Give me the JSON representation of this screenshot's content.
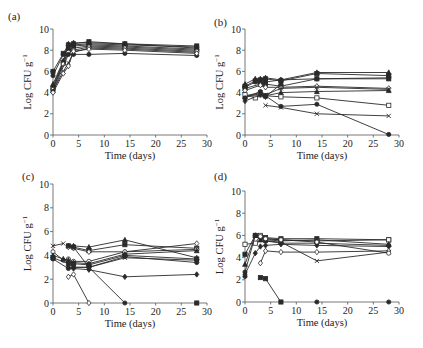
{
  "figure": {
    "background": "#ffffff",
    "line_color": "#2a2a2a",
    "axis_color": "#555555"
  },
  "chart_data": [
    {
      "panel_label": "(a)",
      "type": "line",
      "xlabel": "Time (days)",
      "ylabel": "Log CFU g",
      "ylabel_sup": "−1",
      "xlim": [
        0,
        30
      ],
      "ylim": [
        0,
        10
      ],
      "xticks": [
        0,
        5,
        10,
        15,
        20,
        25,
        30
      ],
      "yticks": [
        0,
        2,
        4,
        6,
        8,
        10
      ],
      "grid": false,
      "legend": "none",
      "frame": {
        "x0": 53,
        "x1": 207,
        "y0": 135,
        "y1": 29,
        "label_x": 8,
        "label_y": 20
      },
      "series": [
        {
          "name": "s1",
          "marker": "square",
          "x": [
            0,
            2,
            3,
            4,
            7,
            14,
            28
          ],
          "y": [
            6.0,
            7.7,
            8.5,
            8.6,
            8.8,
            8.6,
            8.4
          ]
        },
        {
          "name": "s2",
          "marker": "circle",
          "x": [
            0,
            2,
            3,
            4,
            7,
            14,
            28
          ],
          "y": [
            5.6,
            7.6,
            8.3,
            8.5,
            8.6,
            8.5,
            8.3
          ]
        },
        {
          "name": "s3",
          "marker": "triangle",
          "x": [
            0,
            2,
            3,
            4,
            7,
            14,
            28
          ],
          "y": [
            4.8,
            7.0,
            8.6,
            8.7,
            8.7,
            8.6,
            8.2
          ]
        },
        {
          "name": "s4",
          "marker": "diamond",
          "x": [
            0,
            2,
            3,
            4,
            7,
            14,
            28
          ],
          "y": [
            4.6,
            6.9,
            8.4,
            8.4,
            8.5,
            8.4,
            8.1
          ]
        },
        {
          "name": "s5",
          "marker": "square",
          "x": [
            0,
            2,
            3,
            4,
            7,
            14,
            28
          ],
          "y": [
            4.4,
            6.8,
            8.0,
            8.2,
            8.4,
            8.3,
            8.0
          ]
        },
        {
          "name": "s6",
          "marker": "open-circle",
          "x": [
            0,
            2,
            3,
            4,
            7,
            14,
            28
          ],
          "y": [
            4.3,
            6.7,
            7.8,
            8.0,
            8.3,
            8.2,
            7.9
          ]
        },
        {
          "name": "s7",
          "marker": "x",
          "x": [
            0,
            2,
            3,
            4,
            7,
            14,
            28
          ],
          "y": [
            4.2,
            6.0,
            6.8,
            7.8,
            8.2,
            8.1,
            7.8
          ]
        },
        {
          "name": "s8",
          "marker": "circle",
          "x": [
            0,
            3,
            4,
            7,
            14,
            28
          ],
          "y": [
            4.1,
            7.6,
            7.6,
            7.6,
            7.7,
            7.5
          ]
        },
        {
          "name": "s9",
          "marker": "open-diamond",
          "x": [
            0,
            2,
            3,
            4,
            7,
            14,
            28
          ],
          "y": [
            4.0,
            5.8,
            6.5,
            7.9,
            8.1,
            8.0,
            7.7
          ]
        }
      ]
    },
    {
      "panel_label": "(b)",
      "type": "line",
      "xlabel": "Time (days)",
      "ylabel": "Log CFU g",
      "ylabel_sup": "−1",
      "xlim": [
        0,
        30
      ],
      "ylim": [
        0,
        10
      ],
      "xticks": [
        0,
        5,
        10,
        15,
        20,
        25,
        30
      ],
      "yticks": [
        0,
        2,
        4,
        6,
        8,
        10
      ],
      "grid": false,
      "legend": "none",
      "frame": {
        "x0": 245,
        "x1": 399,
        "y0": 135,
        "y1": 29,
        "label_x": 214,
        "label_y": 26
      },
      "series": [
        {
          "name": "s1",
          "marker": "triangle",
          "x": [
            0,
            2,
            3,
            4,
            7,
            14,
            28
          ],
          "y": [
            4.8,
            5.3,
            5.3,
            5.4,
            5.2,
            5.9,
            5.9
          ]
        },
        {
          "name": "s2",
          "marker": "square",
          "x": [
            0,
            2,
            3,
            4,
            7,
            14,
            28
          ],
          "y": [
            4.6,
            5.1,
            5.2,
            5.3,
            5.1,
            5.8,
            5.6
          ]
        },
        {
          "name": "s3",
          "marker": "circle",
          "x": [
            0,
            2,
            3,
            4,
            7,
            14,
            28
          ],
          "y": [
            4.5,
            5.0,
            4.8,
            5.0,
            5.2,
            5.3,
            5.4
          ]
        },
        {
          "name": "s4",
          "marker": "square",
          "x": [
            0,
            3,
            4,
            7,
            14,
            28
          ],
          "y": [
            4.4,
            4.8,
            4.8,
            4.6,
            5.3,
            5.3
          ]
        },
        {
          "name": "s5",
          "marker": "open-diamond",
          "x": [
            0,
            3,
            4,
            7,
            14,
            28
          ],
          "y": [
            4.2,
            4.7,
            4.5,
            4.5,
            4.6,
            4.4
          ]
        },
        {
          "name": "s6",
          "marker": "x",
          "x": [
            0,
            3,
            4,
            7,
            14,
            28
          ],
          "y": [
            3.7,
            4.0,
            3.8,
            4.4,
            4.5,
            4.3
          ]
        },
        {
          "name": "s7",
          "marker": "triangle",
          "x": [
            0,
            3,
            4,
            7,
            14,
            28
          ],
          "y": [
            3.6,
            3.9,
            3.7,
            4.0,
            4.1,
            4.2
          ]
        },
        {
          "name": "s8",
          "marker": "open-square",
          "x": [
            0,
            2,
            3,
            4,
            7,
            14,
            28
          ],
          "y": [
            3.8,
            3.5,
            3.8,
            3.7,
            3.6,
            3.5,
            2.8
          ]
        },
        {
          "name": "s9",
          "marker": "circle",
          "x": [
            0,
            3,
            4,
            7,
            14,
            28
          ],
          "y": [
            3.5,
            4.1,
            3.7,
            2.7,
            2.9,
            0.05
          ]
        },
        {
          "name": "s10",
          "marker": "x",
          "x": [
            4,
            7,
            14,
            28
          ],
          "y": [
            2.8,
            2.6,
            2.0,
            1.8
          ]
        },
        {
          "name": "s11",
          "marker": "diamond",
          "x": [
            0,
            3,
            4,
            7
          ],
          "y": [
            3.2,
            3.8,
            3.6,
            4.8
          ]
        }
      ]
    },
    {
      "panel_label": "(c)",
      "type": "line",
      "xlabel": "Time (days)",
      "ylabel": "Log CFU g",
      "ylabel_sup": "−1",
      "xlim": [
        0,
        30
      ],
      "ylim": [
        0,
        10
      ],
      "xticks": [
        0,
        5,
        10,
        15,
        20,
        25,
        30
      ],
      "yticks": [
        0,
        2,
        4,
        6,
        8,
        10
      ],
      "grid": false,
      "legend": "none",
      "frame": {
        "x0": 53,
        "x1": 207,
        "y0": 303,
        "y1": 184,
        "label_x": 22,
        "label_y": 180
      },
      "series": [
        {
          "name": "s1",
          "marker": "x",
          "x": [
            0,
            2
          ],
          "y": [
            4.8,
            5.0
          ]
        },
        {
          "name": "s2",
          "marker": "triangle",
          "x": [
            3,
            4,
            7,
            14,
            28
          ],
          "y": [
            4.8,
            4.8,
            4.7,
            5.3,
            3.8
          ]
        },
        {
          "name": "s3",
          "marker": "square",
          "x": [
            3,
            4,
            7,
            14,
            28
          ],
          "y": [
            4.8,
            4.7,
            4.4,
            4.9,
            4.6
          ]
        },
        {
          "name": "s4",
          "marker": "open-diamond",
          "x": [
            3,
            4,
            7,
            14,
            28
          ],
          "y": [
            4.7,
            4.6,
            4.3,
            4.3,
            5.0
          ]
        },
        {
          "name": "s5",
          "marker": "circle",
          "x": [
            3,
            4,
            7,
            14
          ],
          "y": [
            4.8,
            4.7,
            3.0,
            0.0
          ]
        },
        {
          "name": "s6",
          "marker": "open-circle",
          "x": [
            0,
            2,
            3,
            4,
            7,
            14,
            28
          ],
          "y": [
            4.3,
            3.6,
            3.7,
            3.5,
            3.5,
            4.3,
            4.5
          ]
        },
        {
          "name": "s7",
          "marker": "triangle",
          "x": [
            0,
            2,
            3,
            4,
            7,
            14,
            28
          ],
          "y": [
            4.0,
            3.7,
            3.6,
            3.4,
            3.3,
            4.1,
            4.4
          ]
        },
        {
          "name": "s8",
          "marker": "square",
          "x": [
            0,
            3,
            4,
            7,
            14,
            28
          ],
          "y": [
            3.8,
            3.3,
            3.3,
            3.2,
            4.0,
            3.7
          ]
        },
        {
          "name": "s9",
          "marker": "circle",
          "x": [
            0,
            3,
            4,
            7,
            14,
            28
          ],
          "y": [
            3.7,
            2.9,
            3.0,
            3.0,
            3.9,
            3.4
          ]
        },
        {
          "name": "s10",
          "marker": "diamond",
          "x": [
            3,
            4,
            7,
            14,
            28
          ],
          "y": [
            3.0,
            2.9,
            2.8,
            2.2,
            2.4
          ]
        },
        {
          "name": "s11",
          "marker": "open-diamond",
          "x": [
            3,
            4,
            7
          ],
          "y": [
            2.2,
            2.4,
            0.0
          ]
        },
        {
          "name": "s12",
          "marker": "x",
          "x": [
            4,
            7,
            14,
            28
          ],
          "y": [
            3.0,
            3.0,
            3.8,
            3.6
          ]
        },
        {
          "name": "s13",
          "marker": "square",
          "x": [
            28
          ],
          "y": [
            0.0
          ]
        }
      ]
    },
    {
      "panel_label": "(d)",
      "type": "line",
      "xlabel": "Time (days)",
      "ylabel": "Log CFU g",
      "ylabel_sup": "−1",
      "xlim": [
        0,
        30
      ],
      "ylim": [
        0,
        10
      ],
      "xticks": [
        0,
        5,
        10,
        15,
        20,
        25,
        30
      ],
      "yticks": [
        0,
        2,
        4,
        6,
        8,
        10
      ],
      "grid": false,
      "legend": "none",
      "frame": {
        "x0": 245,
        "x1": 399,
        "y0": 302,
        "y1": 191,
        "label_x": 214,
        "label_y": 180
      },
      "series": [
        {
          "name": "s1",
          "marker": "square",
          "x": [
            0,
            2,
            3,
            4,
            7,
            14,
            28
          ],
          "y": [
            4.3,
            6.0,
            5.9,
            5.8,
            5.7,
            5.7,
            5.6
          ]
        },
        {
          "name": "s2",
          "marker": "open-square",
          "x": [
            0,
            2,
            3,
            4,
            7,
            14,
            28
          ],
          "y": [
            5.2,
            5.3,
            6.0,
            5.7,
            5.6,
            5.5,
            5.6
          ]
        },
        {
          "name": "s3",
          "marker": "triangle",
          "x": [
            0,
            2,
            3,
            4,
            7,
            14,
            28
          ],
          "y": [
            3.4,
            6.0,
            5.6,
            5.6,
            5.5,
            5.6,
            5.2
          ]
        },
        {
          "name": "s4",
          "marker": "circle",
          "x": [
            0,
            2,
            3,
            4,
            7,
            14,
            28
          ],
          "y": [
            2.7,
            6.0,
            5.8,
            5.5,
            5.3,
            5.3,
            5.1
          ]
        },
        {
          "name": "s5",
          "marker": "diamond",
          "x": [
            0,
            2,
            3,
            4,
            7,
            14,
            28
          ],
          "y": [
            2.5,
            4.4,
            5.0,
            5.1,
            5.2,
            5.1,
            5.0
          ]
        },
        {
          "name": "s6",
          "marker": "open-diamond",
          "x": [
            3,
            4,
            7,
            14,
            28
          ],
          "y": [
            3.5,
            4.6,
            4.5,
            4.5,
            4.6
          ]
        },
        {
          "name": "s7",
          "marker": "x",
          "x": [
            3,
            4,
            7,
            14,
            28
          ],
          "y": [
            5.6,
            5.5,
            5.4,
            3.7,
            4.5
          ]
        },
        {
          "name": "s8",
          "marker": "open-circle",
          "x": [
            3,
            4,
            7,
            14,
            28
          ],
          "y": [
            5.9,
            5.7,
            5.6,
            5.4,
            4.4
          ]
        },
        {
          "name": "s9",
          "marker": "circle",
          "x": [
            0
          ],
          "y": [
            2.3
          ]
        },
        {
          "name": "s10",
          "marker": "square",
          "x": [
            3,
            4,
            7
          ],
          "y": [
            2.2,
            2.1,
            0.0
          ]
        },
        {
          "name": "s11",
          "marker": "circle",
          "x": [
            14,
            28
          ],
          "y": [
            0.0,
            0.0
          ],
          "no_line": true
        }
      ]
    }
  ]
}
